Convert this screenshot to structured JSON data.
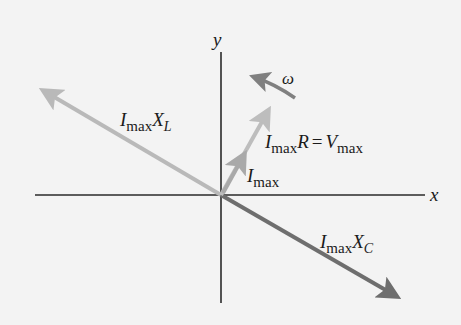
{
  "diagram": {
    "type": "phasor diagram",
    "axes": {
      "x_label": "x",
      "y_label": "y",
      "origin": [
        221,
        195
      ]
    },
    "phasors": [
      {
        "name": "inductor-voltage",
        "label_main": "I",
        "label_sub": "max",
        "label_tail": "X",
        "label_tail_sub": "L",
        "tip": [
          40,
          89
        ],
        "color": "#b9b9b9"
      },
      {
        "name": "capacitor-voltage",
        "label_main": "I",
        "label_sub": "max",
        "label_tail": "X",
        "label_tail_sub": "C",
        "tip": [
          400,
          298
        ],
        "color": "#6e6e6e"
      },
      {
        "name": "resistor-voltage",
        "label_main": "I",
        "label_sub": "max",
        "label_tail": "R",
        "label_eq": "=",
        "label_rhs": "V",
        "label_rhs_sub": "max",
        "tip": [
          270,
          108
        ],
        "color": "#bdbdbd"
      },
      {
        "name": "current",
        "label_main": "I",
        "label_sub": "max",
        "tip": [
          245,
          152
        ],
        "color": "#a9a9a9"
      }
    ],
    "rotation": {
      "label": "ω",
      "color": "#808080"
    }
  }
}
